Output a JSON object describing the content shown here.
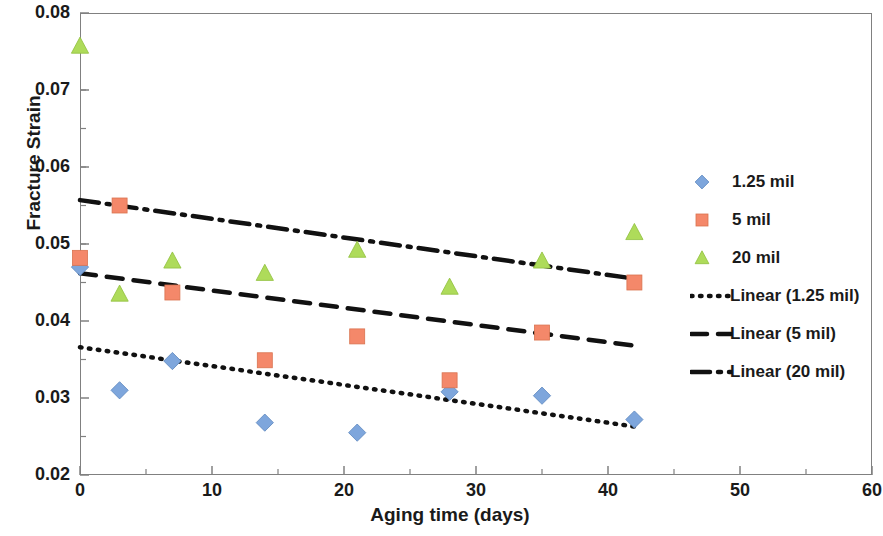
{
  "chart_data": {
    "type": "scatter",
    "title": "",
    "xlabel": "Aging time (days)",
    "ylabel": "Fracture Strain",
    "xlim": [
      0,
      60
    ],
    "ylim": [
      0.02,
      0.08
    ],
    "xticks": [
      "0",
      "10",
      "20",
      "30",
      "40",
      "50",
      "60"
    ],
    "xtick_values": [
      0,
      10,
      20,
      30,
      40,
      50,
      60
    ],
    "xminor_step": 5,
    "yticks": [
      "0.02",
      "0.03",
      "0.04",
      "0.05",
      "0.06",
      "0.07",
      "0.08"
    ],
    "ytick_values": [
      0.02,
      0.03,
      0.04,
      0.05,
      0.06,
      0.07,
      0.08
    ],
    "yminor_step": 0.005,
    "grid": false,
    "legend_position": "right",
    "series": [
      {
        "name": "1.25 mil",
        "marker": "diamond",
        "color": "#7EA6DC",
        "x": [
          0,
          3,
          7,
          14,
          21,
          28,
          35,
          42
        ],
        "y": [
          0.047,
          0.031,
          0.0348,
          0.0268,
          0.0255,
          0.0308,
          0.0303,
          0.0272
        ]
      },
      {
        "name": "5 mil",
        "marker": "square",
        "color": "#F4886A",
        "x": [
          0,
          3,
          7,
          14,
          21,
          28,
          35,
          42
        ],
        "y": [
          0.0482,
          0.055,
          0.0437,
          0.0349,
          0.038,
          0.0323,
          0.0385,
          0.045
        ]
      },
      {
        "name": "20 mil",
        "marker": "triangle",
        "color": "#AEDB5A",
        "x": [
          0,
          3,
          7,
          14,
          21,
          28,
          35,
          42
        ],
        "y": [
          0.0757,
          0.0435,
          0.0478,
          0.0462,
          0.0492,
          0.0444,
          0.0478,
          0.0515
        ]
      }
    ],
    "trendlines": [
      {
        "name": "Linear (1.25 mil)",
        "style": "dotted",
        "color": "#111111",
        "x": [
          0,
          42
        ],
        "y": [
          0.0366,
          0.0263
        ]
      },
      {
        "name": "Linear (5 mil)",
        "style": "dashed",
        "color": "#111111",
        "x": [
          0,
          42
        ],
        "y": [
          0.0462,
          0.0368
        ]
      },
      {
        "name": "Linear (20 mil)",
        "style": "dashdot",
        "color": "#111111",
        "x": [
          0,
          42
        ],
        "y": [
          0.0557,
          0.0455
        ]
      }
    ]
  },
  "legend": {
    "items": [
      {
        "label": "1.25 mil",
        "key": "diamond-marker",
        "color": "#7EA6DC"
      },
      {
        "label": "5 mil",
        "key": "square-marker",
        "color": "#F4886A"
      },
      {
        "label": "20 mil",
        "key": "triangle-marker",
        "color": "#AEDB5A"
      },
      {
        "label": "Linear (1.25 mil)",
        "key": "dotted-line",
        "color": "#111111"
      },
      {
        "label": "Linear (5 mil)",
        "key": "dashed-line",
        "color": "#111111"
      },
      {
        "label": "Linear (20 mil)",
        "key": "dashdot-line",
        "color": "#111111"
      }
    ]
  }
}
